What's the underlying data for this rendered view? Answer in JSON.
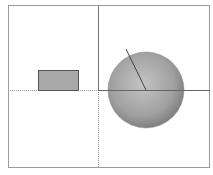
{
  "diagram": {
    "frame": {
      "x": 8,
      "y": 5,
      "w": 202,
      "h": 163,
      "stroke": "#9a9a9a"
    },
    "divider_vertical": {
      "x": 98,
      "y1": 5,
      "y2": 168
    },
    "axis_horizontal_left": {
      "y": 90,
      "x1": 8,
      "x2": 98,
      "style": "dotted"
    },
    "axis_horizontal_right": {
      "y": 90,
      "x1": 98,
      "x2": 210,
      "style": "solid"
    },
    "axis_vertical_lower": {
      "x": 98,
      "y1": 90,
      "y2": 168,
      "style": "dotted"
    },
    "rectangle": {
      "x": 38,
      "y": 70,
      "w": 41,
      "h": 21,
      "fill": "#a8a8a8",
      "stroke": "#555555"
    },
    "sphere": {
      "cx": 146,
      "cy": 90,
      "r": 38,
      "fill_light": "#bdbdbd",
      "fill_dark": "#7a7a7a"
    },
    "radius_line": {
      "x1": 146,
      "y1": 90,
      "x2": 126,
      "y2": 49,
      "stroke": "#444444"
    }
  }
}
